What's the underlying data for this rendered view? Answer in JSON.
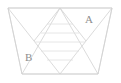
{
  "figure": {
    "background_color": "#ffffff",
    "stroke_color": "#d2d2d2",
    "stroke_color_faint": "#e0e0e0",
    "label_color": "#8e8e8e",
    "stroke_width": 0.8,
    "viewbox": "0 0 121 83",
    "labels": [
      {
        "id": "A",
        "text": "A",
        "x": 88,
        "y": 20,
        "region": "upper-right"
      },
      {
        "id": "B",
        "text": "B",
        "x": 28,
        "y": 58,
        "region": "lower-left"
      }
    ],
    "outline": {
      "shape": "trapezoid",
      "points": "8,8 112,8 98,74 22,74"
    },
    "segments": [
      {
        "name": "top-edge",
        "x1": 8,
        "y1": 8,
        "x2": 112,
        "y2": 8
      },
      {
        "name": "bottom-edge",
        "x1": 22,
        "y1": 74,
        "x2": 98,
        "y2": 74
      },
      {
        "name": "left-edge",
        "x1": 8,
        "y1": 8,
        "x2": 22,
        "y2": 74
      },
      {
        "name": "right-edge",
        "x1": 112,
        "y1": 8,
        "x2": 98,
        "y2": 74
      },
      {
        "name": "left-diagonal-down",
        "x1": 8,
        "y1": 8,
        "x2": 60,
        "y2": 74
      },
      {
        "name": "right-diagonal-down",
        "x1": 112,
        "y1": 8,
        "x2": 60,
        "y2": 74
      },
      {
        "name": "center-left-diagonal",
        "x1": 60,
        "y1": 8,
        "x2": 22,
        "y2": 74
      },
      {
        "name": "center-right-diagonal",
        "x1": 60,
        "y1": 8,
        "x2": 98,
        "y2": 74
      },
      {
        "name": "mid-left-diagonal",
        "x1": 34,
        "y1": 41,
        "x2": 60,
        "y2": 8
      },
      {
        "name": "mid-right-diagonal",
        "x1": 86,
        "y1": 41,
        "x2": 60,
        "y2": 8
      }
    ],
    "ladder_lines": [
      {
        "name": "ladder-1",
        "x1": 47,
        "y1": 24,
        "x2": 73,
        "y2": 24
      },
      {
        "name": "ladder-2",
        "x1": 41,
        "y1": 33,
        "x2": 79,
        "y2": 33
      },
      {
        "name": "ladder-3",
        "x1": 35,
        "y1": 42,
        "x2": 85,
        "y2": 42
      },
      {
        "name": "ladder-4",
        "x1": 41,
        "y1": 51,
        "x2": 79,
        "y2": 51
      },
      {
        "name": "ladder-5",
        "x1": 47,
        "y1": 60,
        "x2": 73,
        "y2": 60
      }
    ]
  }
}
